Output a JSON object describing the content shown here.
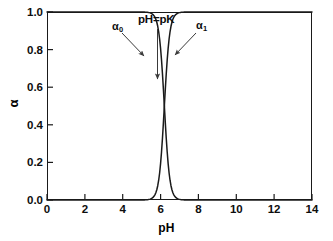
{
  "chart_data": {
    "type": "line",
    "title": "",
    "xlabel": "pH",
    "ylabel": "α",
    "xlim": [
      0,
      14
    ],
    "ylim": [
      0.0,
      1.0
    ],
    "xticks": [
      0,
      2,
      4,
      6,
      8,
      10,
      12,
      14
    ],
    "yticks": [
      "0.0",
      "0.2",
      "0.4",
      "0.6",
      "0.8",
      "1.0"
    ],
    "grid": false,
    "legend": "none",
    "pK": 6.2,
    "series": [
      {
        "name": "α₀",
        "description": "fraction of protonated (acid) form, descending sigmoid",
        "x": [
          0,
          1,
          2,
          3,
          3.5,
          4,
          4.5,
          5,
          5.25,
          5.5,
          5.75,
          6,
          6.2,
          6.4,
          6.6,
          6.8,
          7,
          7.25,
          7.5,
          8,
          8.5,
          9,
          10,
          11,
          12,
          13,
          14
        ],
        "y": [
          1.0,
          1.0,
          1.0,
          1.0,
          0.999,
          0.997,
          0.989,
          0.962,
          0.931,
          0.876,
          0.791,
          0.672,
          0.574,
          0.469,
          0.366,
          0.273,
          0.195,
          0.122,
          0.073,
          0.025,
          0.008,
          0.003,
          0.0003,
          0.0,
          0.0,
          0.0,
          0.0
        ]
      },
      {
        "name": "α₁",
        "description": "fraction of deprotonated (base) form, ascending sigmoid",
        "x": [
          0,
          1,
          2,
          3,
          3.5,
          4,
          4.5,
          5,
          5.25,
          5.5,
          5.75,
          6,
          6.2,
          6.4,
          6.6,
          6.8,
          7,
          7.25,
          7.5,
          8,
          8.5,
          9,
          10,
          11,
          12,
          13,
          14
        ],
        "y": [
          0.0,
          0.0,
          0.0,
          0.0,
          0.001,
          0.003,
          0.011,
          0.038,
          0.069,
          0.124,
          0.209,
          0.328,
          0.426,
          0.531,
          0.634,
          0.727,
          0.805,
          0.878,
          0.927,
          0.975,
          0.992,
          0.997,
          0.9997,
          1.0,
          1.0,
          1.0,
          1.0
        ]
      }
    ],
    "annotations": [
      {
        "name": "alpha0-label",
        "text": "α₀",
        "points_to": "descending curve"
      },
      {
        "name": "alpha1-label",
        "text": "α₁",
        "points_to": "ascending curve"
      },
      {
        "name": "phpk-label",
        "text": "pH=pK",
        "points_to": "curve crossing at alpha = 0.5"
      }
    ]
  },
  "axes": {
    "x_title": "pH",
    "y_title": "α",
    "x_tick_labels": [
      "0",
      "2",
      "4",
      "6",
      "8",
      "10",
      "12",
      "14"
    ],
    "y_tick_labels": [
      "0.0",
      "0.2",
      "0.4",
      "0.6",
      "0.8",
      "1.0"
    ]
  },
  "annotations": {
    "alpha0": "α",
    "alpha0_sub": "0",
    "alpha1": "α",
    "alpha1_sub": "1",
    "phpk": "pH=pK"
  },
  "colors": {
    "curve": "#1a1a1a",
    "frame": "#1a1a1a",
    "arrow": "#3a3a3a",
    "background": "#ffffff"
  }
}
